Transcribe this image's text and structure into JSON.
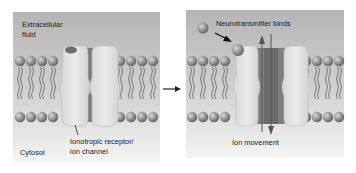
{
  "figure": {
    "left_panel": {
      "labels": {
        "extracellular_line1": "Extracellular",
        "extracellular_line2": "fluid",
        "cytosol": "Cytosol",
        "receptor_line1": "Ionotropic receptor/",
        "receptor_line2": "ion channel"
      },
      "state": "closed"
    },
    "transition_arrow": "→",
    "right_panel": {
      "labels": {
        "neurotransmitter": "Neurotransmitter binds",
        "ion_movement": "Ion movement"
      },
      "state": "open"
    },
    "colors": {
      "background_top": "#b8b8b8",
      "background_bottom": "#f2f2f2",
      "lipid_head": "#8e8e8e",
      "protein_light": "#e3e3e3",
      "protein_dark": "#7c7c7c",
      "arrow": "#222222"
    }
  }
}
